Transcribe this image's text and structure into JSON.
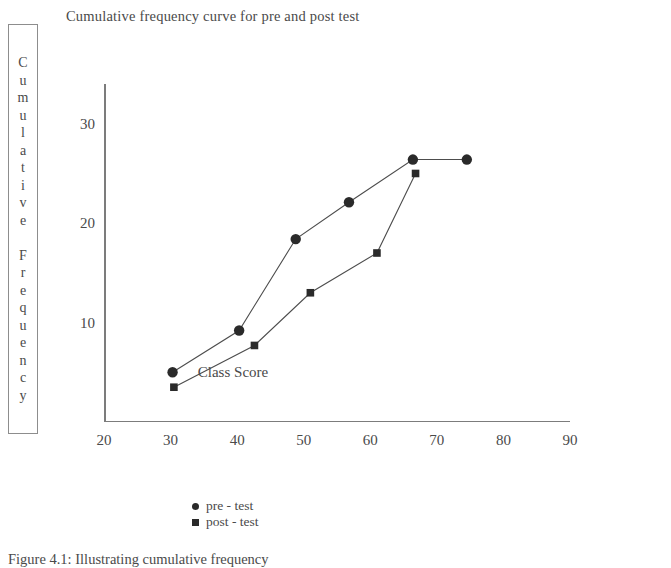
{
  "chart_data": {
    "type": "line",
    "title": "Cumulative frequency curve for pre and post test",
    "xlabel": "Class Score",
    "ylabel": "Cumulative Frequency",
    "ylabel_letters": [
      "C",
      "u",
      "m",
      "u",
      "l",
      "a",
      "t",
      "i",
      "v",
      "e",
      "",
      "F",
      "r",
      "e",
      "q",
      "u",
      "e",
      "n",
      "c",
      "y"
    ],
    "xlim": [
      20,
      90
    ],
    "ylim": [
      0,
      34
    ],
    "xticks": [
      20,
      30,
      40,
      50,
      60,
      70,
      80,
      90
    ],
    "yticks": [
      10,
      20,
      30
    ],
    "grid": false,
    "legend_position": "bottom-center",
    "series": [
      {
        "name": "pre - test",
        "marker": "circle",
        "color": "#2a2a2a",
        "points": [
          {
            "x": 30.3,
            "y": 5.0
          },
          {
            "x": 40.3,
            "y": 9.2
          },
          {
            "x": 48.8,
            "y": 18.4
          },
          {
            "x": 56.8,
            "y": 22.1
          },
          {
            "x": 66.4,
            "y": 26.4
          },
          {
            "x": 74.5,
            "y": 26.4
          }
        ]
      },
      {
        "name": "post - test",
        "marker": "square",
        "color": "#2a2a2a",
        "points": [
          {
            "x": 30.5,
            "y": 3.5
          },
          {
            "x": 42.6,
            "y": 7.7
          },
          {
            "x": 51.0,
            "y": 13.0
          },
          {
            "x": 61.0,
            "y": 17.0
          },
          {
            "x": 66.8,
            "y": 25.0
          }
        ]
      }
    ]
  },
  "legend": {
    "entries": [
      {
        "label": "pre - test"
      },
      {
        "label": "post - test"
      }
    ]
  },
  "caption": {
    "text": "Figure 4.1: Illustrating cumulative frequency"
  }
}
